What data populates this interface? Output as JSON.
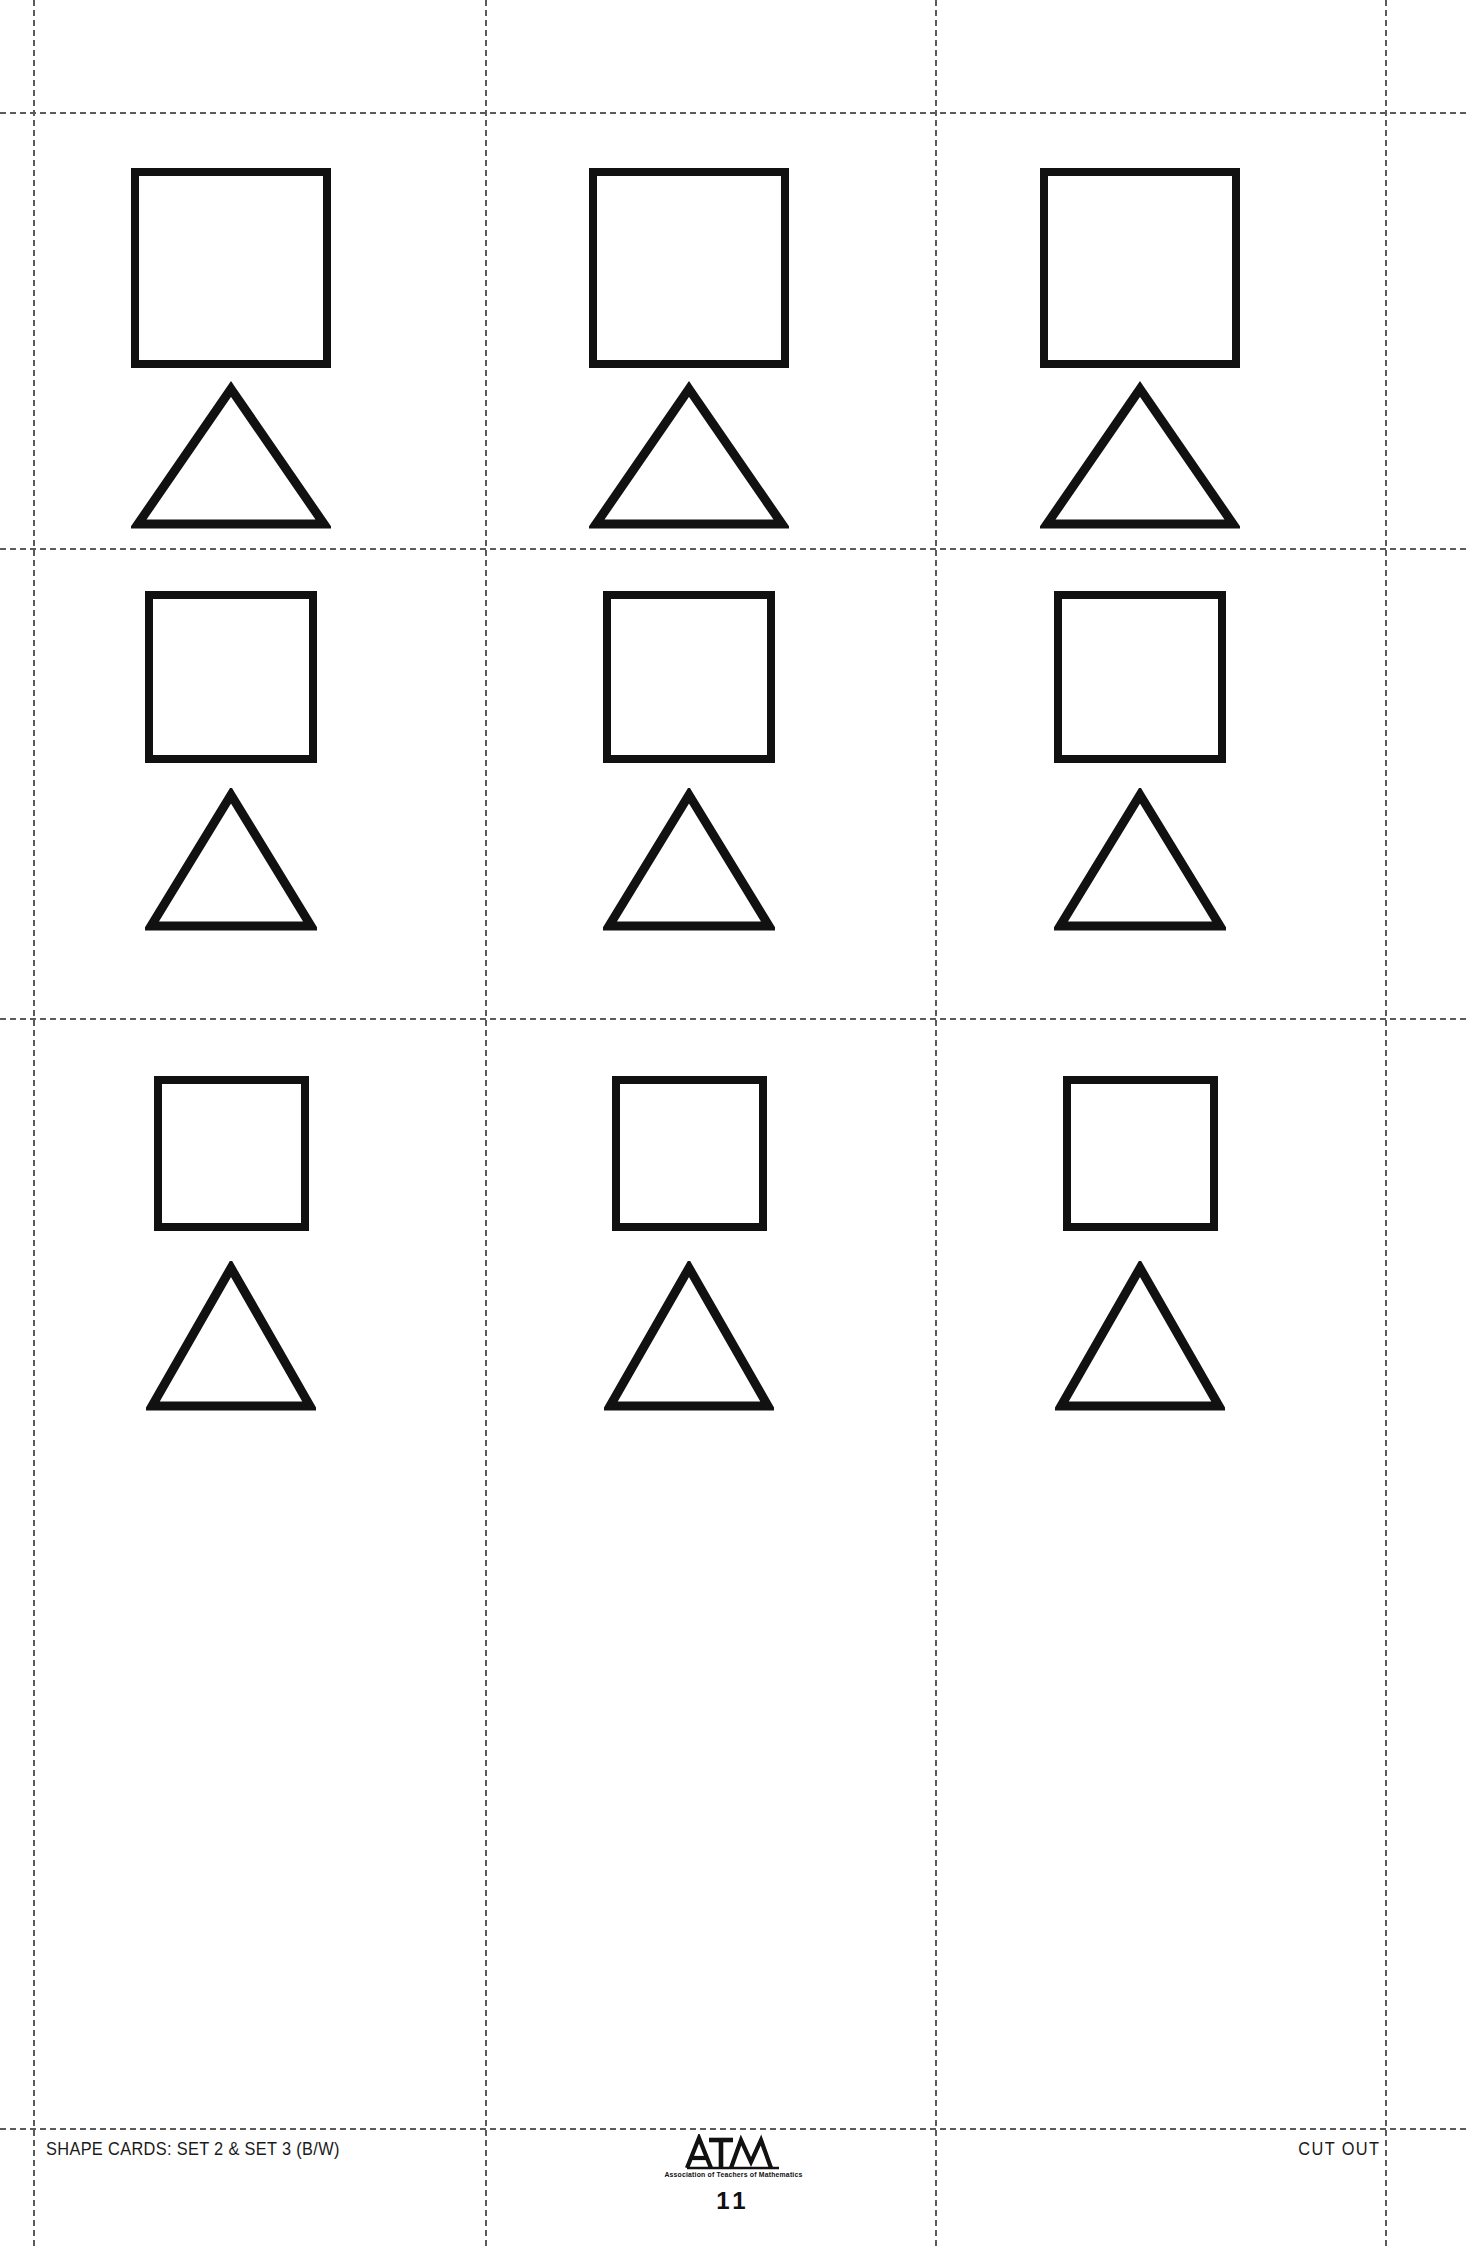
{
  "document": {
    "title": "Shape Cards: Set 2 & Set 3 (B/W)",
    "page_number": "11",
    "width": 1466,
    "height": 2246,
    "background_color": "#ffffff",
    "ink_color": "#111111",
    "cut_line_color": "#5b5b5b"
  },
  "footer": {
    "left_label": "SHAPE CARDS: SET 2 & SET 3 (B/W)",
    "right_label": "CUT OUT",
    "logo_text": "ATM",
    "logo_tagline": "Association of Teachers of Mathematics",
    "page_number": "11"
  },
  "cut_guides": {
    "vertical_x": [
      33,
      485,
      935,
      1385
    ],
    "horizontal_y": [
      112,
      548,
      1018,
      2128
    ],
    "style": "dashed"
  },
  "grid": {
    "rows": 3,
    "columns": 3,
    "cards": [
      {
        "id": "card-r1c1",
        "row": 1,
        "column": 1,
        "shapes": [
          {
            "type": "square",
            "label": "square",
            "size_px": 200
          },
          {
            "type": "triangle",
            "label": "triangle",
            "base_px": 200,
            "height_px": 150
          }
        ]
      },
      {
        "id": "card-r1c2",
        "row": 1,
        "column": 2,
        "shapes": [
          {
            "type": "square",
            "label": "square",
            "size_px": 200
          },
          {
            "type": "triangle",
            "label": "triangle",
            "base_px": 200,
            "height_px": 150
          }
        ]
      },
      {
        "id": "card-r1c3",
        "row": 1,
        "column": 3,
        "shapes": [
          {
            "type": "square",
            "label": "square",
            "size_px": 200
          },
          {
            "type": "triangle",
            "label": "triangle",
            "base_px": 200,
            "height_px": 150
          }
        ]
      },
      {
        "id": "card-r2c1",
        "row": 2,
        "column": 1,
        "shapes": [
          {
            "type": "square",
            "label": "square",
            "size_px": 172
          },
          {
            "type": "triangle",
            "label": "triangle",
            "base_px": 172,
            "height_px": 145
          }
        ]
      },
      {
        "id": "card-r2c2",
        "row": 2,
        "column": 2,
        "shapes": [
          {
            "type": "square",
            "label": "square",
            "size_px": 172
          },
          {
            "type": "triangle",
            "label": "triangle",
            "base_px": 172,
            "height_px": 145
          }
        ]
      },
      {
        "id": "card-r2c3",
        "row": 2,
        "column": 3,
        "shapes": [
          {
            "type": "square",
            "label": "square",
            "size_px": 172
          },
          {
            "type": "triangle",
            "label": "triangle",
            "base_px": 172,
            "height_px": 145
          }
        ]
      },
      {
        "id": "card-r3c1",
        "row": 3,
        "column": 1,
        "shapes": [
          {
            "type": "square",
            "label": "square",
            "size_px": 155
          },
          {
            "type": "triangle",
            "label": "triangle",
            "base_px": 170,
            "height_px": 152
          }
        ]
      },
      {
        "id": "card-r3c2",
        "row": 3,
        "column": 2,
        "shapes": [
          {
            "type": "square",
            "label": "square",
            "size_px": 155
          },
          {
            "type": "triangle",
            "label": "triangle",
            "base_px": 170,
            "height_px": 152
          }
        ]
      },
      {
        "id": "card-r3c3",
        "row": 3,
        "column": 3,
        "shapes": [
          {
            "type": "square",
            "label": "square",
            "size_px": 155
          },
          {
            "type": "triangle",
            "label": "triangle",
            "base_px": 170,
            "height_px": 152
          }
        ]
      }
    ]
  }
}
